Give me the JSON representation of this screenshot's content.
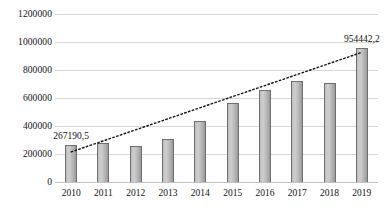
{
  "chart_data": {
    "type": "bar",
    "title": "",
    "subtitle": "",
    "xlabel": "",
    "ylabel": "",
    "categories": [
      "2010",
      "2011",
      "2012",
      "2013",
      "2014",
      "2015",
      "2016",
      "2017",
      "2018",
      "2019"
    ],
    "values": [
      267190.5,
      280000,
      260000,
      310000,
      435000,
      565000,
      660000,
      725000,
      710000,
      954442.2
    ],
    "series": [
      {
        "name": "bars",
        "values": [
          267190.5,
          280000,
          260000,
          310000,
          435000,
          565000,
          660000,
          725000,
          710000,
          954442.2
        ]
      },
      {
        "name": "trendline",
        "type": "line",
        "style": "dotted",
        "color": "#111111",
        "values": [
          215000,
          294000,
          373000,
          452000,
          531000,
          610000,
          689000,
          768000,
          847000,
          926000
        ]
      }
    ],
    "data_labels": [
      {
        "category": "2010",
        "text": "267190,5"
      },
      {
        "category": "2019",
        "text": "954442,2"
      }
    ],
    "ylim": [
      0,
      1200000
    ],
    "ytick_values": [
      0,
      200000,
      400000,
      600000,
      800000,
      1000000,
      1200000
    ],
    "ytick_labels": [
      "0",
      "200000",
      "400000",
      "600000",
      "800000",
      "1000000",
      "1200000"
    ],
    "grid": true,
    "legend": "none",
    "bar_color": "#b4b4b4",
    "grid_color": "#d6d6d6"
  }
}
